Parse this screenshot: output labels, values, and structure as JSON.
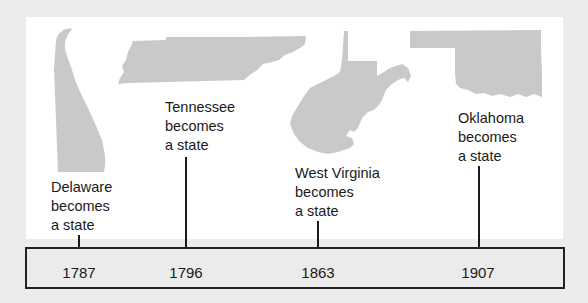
{
  "colors": {
    "background": "#ececec",
    "panel": "#ffffff",
    "state_fill": "#c9c9c9",
    "line": "#1a1a1a",
    "timeline_border": "#222222",
    "timeline_fill": "#ebebeb"
  },
  "events": [
    {
      "state": "Delaware",
      "line1": "Delaware",
      "line2": "becomes",
      "line3": "a state",
      "year": "1787",
      "icon": "delaware-silhouette"
    },
    {
      "state": "Tennessee",
      "line1": "Tennessee",
      "line2": "becomes",
      "line3": "a state",
      "year": "1796",
      "icon": "tennessee-silhouette"
    },
    {
      "state": "West Virginia",
      "line1": "West Virginia",
      "line2": "becomes",
      "line3": "a state",
      "year": "1863",
      "icon": "west-virginia-silhouette"
    },
    {
      "state": "Oklahoma",
      "line1": "Oklahoma",
      "line2": "becomes",
      "line3": "a state",
      "year": "1907",
      "icon": "oklahoma-silhouette"
    }
  ]
}
